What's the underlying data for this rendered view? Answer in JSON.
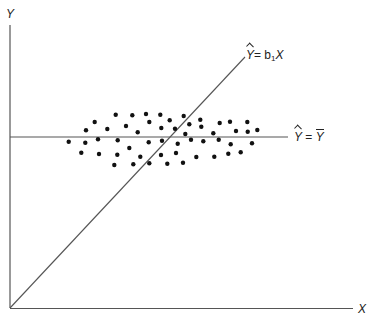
{
  "diagram": {
    "axes": {
      "y_label": "Y",
      "x_label": "X",
      "origin": [
        10,
        308
      ],
      "y_axis_top": 25,
      "x_axis_right": 353,
      "color": "#555555"
    },
    "lines": {
      "regression_through_origin": {
        "label_prefix": "Y",
        "label_eq": "= b",
        "label_sub": "1",
        "label_suffix": "X",
        "from": [
          10,
          308
        ],
        "to": [
          245,
          57
        ]
      },
      "horizontal_mean": {
        "label_left": "Y",
        "label_eq": "=",
        "label_right": "Y",
        "y": 137,
        "x_start": 10,
        "x_end": 288
      }
    },
    "points": [
      [
        115.7,
        114.7
      ],
      [
        132.3,
        115.3
      ],
      [
        146,
        114
      ],
      [
        160.3,
        114.7
      ],
      [
        169.7,
        120.3
      ],
      [
        183.7,
        116
      ],
      [
        200.3,
        119.7
      ],
      [
        94.7,
        122
      ],
      [
        149.3,
        122
      ],
      [
        189.3,
        124.3
      ],
      [
        201.3,
        126.7
      ],
      [
        219.7,
        123
      ],
      [
        230,
        121.7
      ],
      [
        247.3,
        122
      ],
      [
        86,
        130.3
      ],
      [
        107.3,
        129
      ],
      [
        126,
        126
      ],
      [
        137.7,
        132.3
      ],
      [
        161.3,
        128
      ],
      [
        175,
        128.7
      ],
      [
        185.3,
        134
      ],
      [
        213.3,
        133.3
      ],
      [
        236,
        131
      ],
      [
        247.7,
        131.7
      ],
      [
        257.3,
        130
      ],
      [
        68.7,
        141.7
      ],
      [
        85.3,
        142.7
      ],
      [
        98,
        139.3
      ],
      [
        117.7,
        140.3
      ],
      [
        148.7,
        142.3
      ],
      [
        162,
        140.7
      ],
      [
        177.7,
        143.7
      ],
      [
        191,
        139.7
      ],
      [
        203.3,
        141.3
      ],
      [
        218.7,
        139.7
      ],
      [
        230.7,
        144.3
      ],
      [
        252,
        143.3
      ],
      [
        81.3,
        152.7
      ],
      [
        99,
        154
      ],
      [
        117.3,
        154.7
      ],
      [
        129.3,
        148
      ],
      [
        140.3,
        156.7
      ],
      [
        161,
        155
      ],
      [
        176,
        153
      ],
      [
        196.3,
        157
      ],
      [
        214.3,
        156.7
      ],
      [
        228.3,
        153.7
      ],
      [
        240.7,
        152.3
      ],
      [
        114.3,
        165
      ],
      [
        133.3,
        164.3
      ],
      [
        149.3,
        163.3
      ],
      [
        167.3,
        163.7
      ],
      [
        183,
        162.7
      ]
    ],
    "point_color": "#111111",
    "line_color": "#555555"
  }
}
